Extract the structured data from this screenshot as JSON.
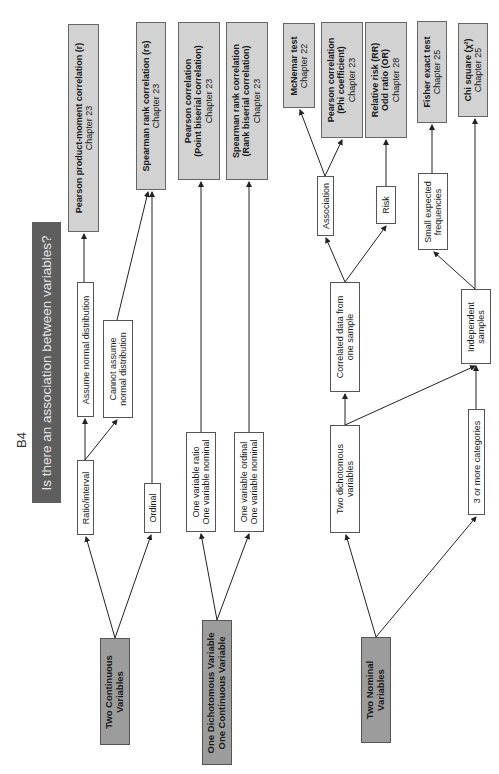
{
  "figure_label": "B4",
  "title": "Is there an association between variables?",
  "sources": [
    {
      "id": "two-continuous",
      "lines": [
        "Two Continuous",
        "Variables"
      ]
    },
    {
      "id": "one-dichotomous-one-continuous",
      "lines": [
        "One Dichotomous Variable",
        "One Continuous Variable"
      ]
    },
    {
      "id": "two-nominal",
      "lines": [
        "Two Nominal",
        "Variables"
      ]
    }
  ],
  "intermediate": {
    "ratio_interval": "Ratio/interval",
    "ordinal": "Ordinal",
    "assume_normal": "Assume normal distribution",
    "cannot_assume": [
      "Cannot assume",
      "normal distribution"
    ],
    "ratio_nominal": [
      "One variable ratio",
      "One variable nominal"
    ],
    "ordinal_nominal": [
      "One variable ordinal",
      "One variable nominal"
    ],
    "two_dichotomous": [
      "Two dichotomous",
      "variables"
    ],
    "three_or_more": "3 or more categories",
    "correlated": [
      "Correlated data from",
      "one sample"
    ],
    "independent": [
      "Independent",
      "samples"
    ],
    "association": "Association",
    "risk": "Risk",
    "small_expected": [
      "Small expected",
      "frequencies"
    ]
  },
  "outcomes": [
    {
      "id": "pearson-r",
      "title": "Pearson product-moment correlation (r)",
      "chapter": "Chapter 23"
    },
    {
      "id": "spearman-rs",
      "title": "Spearman rank correlation (rs)",
      "chapter": "Chapter 23"
    },
    {
      "id": "pearson-point-biserial",
      "title": "Pearson correlation",
      "subtitle": "(Point biserial correlation)",
      "chapter": "Chapter 23"
    },
    {
      "id": "spearman-rank-biserial",
      "title": "Spearman rank correlation",
      "subtitle": "(Rank biserial correlation)",
      "chapter": "Chapter 23"
    },
    {
      "id": "mcnemar",
      "title": "McNemar test",
      "chapter": "Chapter 22"
    },
    {
      "id": "pearson-phi",
      "title": "Pearson correlation",
      "subtitle": "(Phi coefficient)",
      "chapter": "Chapter 23"
    },
    {
      "id": "rr-or",
      "title": "Relative risk (RR)",
      "subtitle": "Odd ratio (OR)",
      "chapter": "Chapter 28"
    },
    {
      "id": "fisher",
      "title": "Fisher exact test",
      "chapter": "Chapter 25"
    },
    {
      "id": "chi-square",
      "title": "Chi square (χ²)",
      "chapter": "Chapter 25"
    }
  ],
  "colors": {
    "title_bg": "#5e5e5e",
    "source_bg": "#9c9c9c",
    "outcome_bg": "#d2d2d2",
    "line": "#222222"
  }
}
